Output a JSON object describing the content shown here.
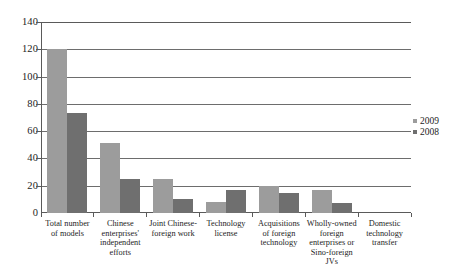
{
  "chart_data": {
    "type": "bar",
    "title": "",
    "xlabel": "",
    "ylabel": "",
    "ylim": [
      0,
      140
    ],
    "yticks": [
      0,
      20,
      40,
      60,
      80,
      100,
      120,
      140
    ],
    "grid": true,
    "legend_position": "right",
    "categories": [
      "Total number of models",
      "Chinese enterprises' independent efforts",
      "Joint Chinese-foreign work",
      "Technology license",
      "Acquisitions of foreign technology",
      "Wholly-owned foreign enterprises or Sino-foreign JVs",
      "Domestic technology transfer"
    ],
    "series": [
      {
        "name": "2009",
        "color": "#9c9c9c",
        "values": [
          120,
          51,
          25,
          8,
          20,
          17,
          0
        ]
      },
      {
        "name": "2008",
        "color": "#6f6f6f",
        "values": [
          73,
          25,
          10,
          17,
          15,
          7,
          0
        ]
      }
    ]
  },
  "axis": {
    "y_tick_labels": [
      "140",
      "120",
      "100",
      "80",
      "60",
      "40",
      "20",
      "0"
    ]
  },
  "legend": {
    "entries": [
      {
        "label": "2009"
      },
      {
        "label": "2008"
      }
    ]
  },
  "colors": {
    "series_2009": "#9c9c9c",
    "series_2008": "#6f6f6f",
    "axis": "#5a5a5a",
    "gridline": "#6d6d6d",
    "text": "#1d1d1d",
    "background": "#ffffff"
  }
}
